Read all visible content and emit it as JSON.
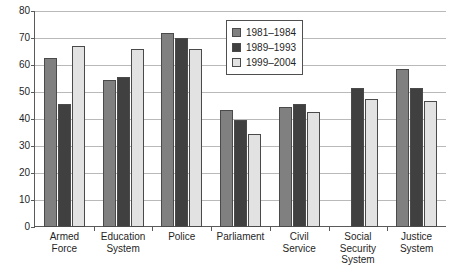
{
  "chart_data": {
    "type": "bar",
    "title": "",
    "xlabel": "",
    "ylabel": "",
    "ylim": [
      0,
      80
    ],
    "grid": true,
    "legend_position": "top-center",
    "y_ticks": [
      0,
      10,
      20,
      30,
      40,
      50,
      60,
      70,
      80
    ],
    "y_tick_labels": [
      "0",
      "10",
      "20",
      "30",
      "40",
      "50",
      "60",
      "70",
      "80"
    ],
    "categories": [
      "Armed Force",
      "Education System",
      "Police",
      "Parliament",
      "Civil Service",
      "Social Security System",
      "Justice System"
    ],
    "category_lines": [
      [
        "Armed",
        "Force"
      ],
      [
        "Education",
        "System"
      ],
      [
        "Police"
      ],
      [
        "Parliament"
      ],
      [
        "Civil",
        "Service"
      ],
      [
        "Social",
        "Security",
        "System"
      ],
      [
        "Justice",
        "System"
      ]
    ],
    "series": [
      {
        "name": "1981–1984",
        "color": "#808080",
        "values": [
          62.5,
          54.5,
          72,
          43.5,
          44.5,
          null,
          58.5
        ]
      },
      {
        "name": "1989–1993",
        "color": "#404040",
        "values": [
          45.5,
          55.5,
          70,
          39.5,
          45.5,
          51.5,
          51.5
        ]
      },
      {
        "name": "1999–2004",
        "color": "#e2e2e2",
        "values": [
          67,
          66,
          66,
          34.5,
          42.5,
          47.5,
          46.5
        ]
      }
    ]
  },
  "legend": {
    "items": [
      {
        "label": "1981–1984",
        "color": "#808080"
      },
      {
        "label": "1989–1993",
        "color": "#404040"
      },
      {
        "label": "1999–2004",
        "color": "#e2e2e2"
      }
    ]
  },
  "axes": {
    "y_tick_labels": [
      "80",
      "70",
      "60",
      "50",
      "40",
      "30",
      "20",
      "10",
      "0"
    ]
  },
  "title_sliver": {
    "text": ""
  }
}
